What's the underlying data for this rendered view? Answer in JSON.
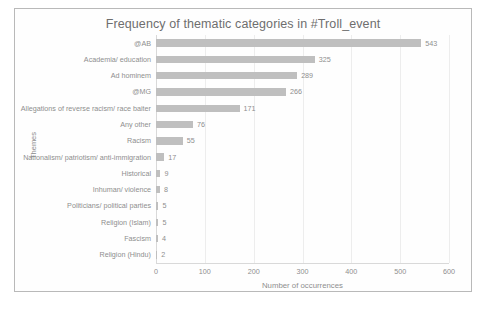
{
  "chart_data": {
    "type": "bar",
    "orientation": "horizontal",
    "title": "Frequency of thematic categories in #Troll_event",
    "xlabel": "Number of occurrences",
    "ylabel": "Themes",
    "xlim": [
      0,
      600
    ],
    "xticks": [
      0,
      100,
      200,
      300,
      400,
      500,
      600
    ],
    "xtick_labels": [
      "0",
      "100",
      "200",
      "300",
      "400",
      "500",
      "600"
    ],
    "grid": true,
    "legend": false,
    "bar_color": "#bfbfbf",
    "text_color": "#8e8e8e",
    "title_color": "#6e6e6e",
    "categories": [
      "@AB",
      "Academia/ education",
      "Ad hominem",
      "@MG",
      "Allegations of reverse racism/ race baiter",
      "Any other",
      "Racism",
      "Nationalism/ patriotism/ anti-immigration",
      "Historical",
      "Inhuman/ violence",
      "Politicians/ political parties",
      "Religion (Islam)",
      "Fascism",
      "Religion (Hindu)"
    ],
    "values": [
      543,
      325,
      289,
      266,
      171,
      76,
      55,
      17,
      9,
      8,
      5,
      5,
      4,
      2
    ],
    "value_labels": [
      "543",
      "325",
      "289",
      "266",
      "171",
      "76",
      "55",
      "17",
      "9",
      "8",
      "5",
      "5",
      "4",
      "2"
    ]
  }
}
